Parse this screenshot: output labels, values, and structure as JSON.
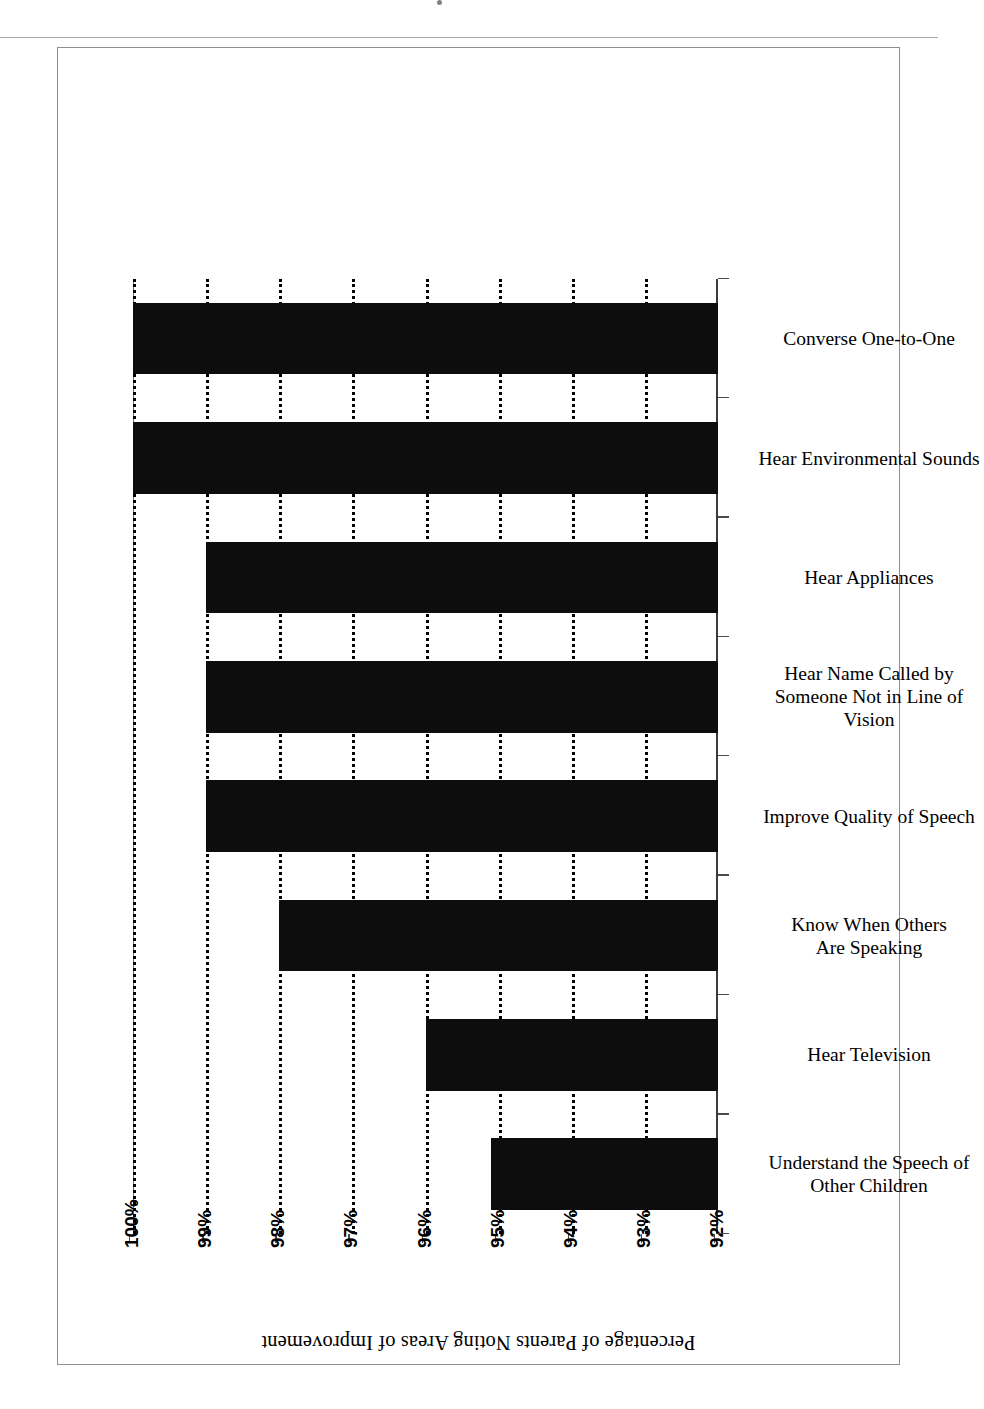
{
  "figure": {
    "kind": "bar-chart",
    "frame_border_color": "#8e8e93",
    "bar_color": "#0d0d0d",
    "background": "#ffffff"
  },
  "chart_data": {
    "type": "bar",
    "title": "Percentage of Parents Noting Areas of Improvement",
    "xlabel": "",
    "ylabel": "",
    "orientation": "vertical",
    "grid": true,
    "grid_style": "dotted",
    "legend": null,
    "ylim": [
      92,
      100
    ],
    "ytick_values": [
      92,
      93,
      94,
      95,
      96,
      97,
      98,
      99,
      100
    ],
    "ytick_labels": [
      "92%",
      "93%",
      "94%",
      "95%",
      "96%",
      "97%",
      "98%",
      "99%",
      "100%"
    ],
    "categories": [
      "Understand the Speech of Other Children",
      "Hear Television",
      "Know When Others Are Speaking",
      "Improve Quality of Speech",
      "Hear Name Called by Someone Not in Line of Vision",
      "Hear Appliances",
      "Hear Environmental Sounds",
      "Converse One-to-One"
    ],
    "category_label_lines": [
      [
        "Understand the Speech of",
        "Other Children"
      ],
      [
        "Hear Television"
      ],
      [
        "Know When Others",
        "Are Speaking"
      ],
      [
        "Improve Quality of Speech"
      ],
      [
        "Hear Name Called by",
        "Someone Not in Line of",
        "Vision"
      ],
      [
        "Hear Appliances"
      ],
      [
        "Hear Environmental Sounds"
      ],
      [
        "Converse One-to-One"
      ]
    ],
    "values": [
      95.1,
      96,
      98,
      99,
      99,
      99,
      100,
      100
    ],
    "value_labels": [
      "95%",
      "96%",
      "98%",
      "99%",
      "99%",
      "99%",
      "100%",
      "100%"
    ]
  }
}
